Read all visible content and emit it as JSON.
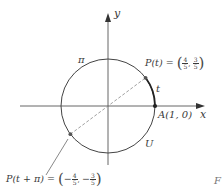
{
  "diagram": {
    "type": "unit-circle",
    "colors": {
      "axis": "#555555",
      "circle": "#444444",
      "arc_t": "#222222",
      "dashed_line": "#888888",
      "point": "#333333",
      "text": "#3a3a3a"
    },
    "axes": {
      "x_label": "x",
      "y_label": "y"
    },
    "circle": {
      "label": "U",
      "arc_label_pi": "π"
    },
    "arc": {
      "label": "t"
    },
    "point_A": {
      "label": "A(1, 0)"
    },
    "point_P": {
      "label_prefix": "P(t) = ",
      "x_num": "4",
      "x_den": "5",
      "y_num": "3",
      "y_den": "5",
      "x_sign": "",
      "y_sign": ""
    },
    "point_P_pi": {
      "label_prefix": "P(t + π) = ",
      "x_num": "4",
      "x_den": "5",
      "y_num": "3",
      "y_den": "5",
      "x_sign": "−",
      "y_sign": "−"
    },
    "cropped_edge_text": "F"
  }
}
